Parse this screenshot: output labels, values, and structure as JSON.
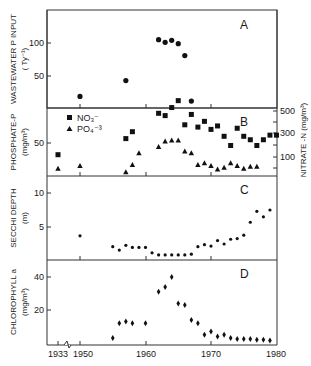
{
  "chart_data": [
    {
      "panel": "A",
      "type": "scatter",
      "title": "",
      "ylabel": "WASTEWATER P INPUT",
      "ylabel_units": "(Ty⁻¹)",
      "xlabel": "",
      "yticks": [
        50,
        100
      ],
      "ylim": [
        0,
        148
      ],
      "series": [
        {
          "name": "Wastewater P input",
          "marker": "circle",
          "x": [
            1950,
            1957,
            1962,
            1963,
            1964,
            1965,
            1966,
            1967
          ],
          "y": [
            19,
            43,
            105,
            101,
            104,
            99,
            81,
            12
          ]
        }
      ]
    },
    {
      "panel": "B",
      "type": "scatter",
      "ylabel": "PHOSPHATE-P",
      "ylabel_units": "(mg/m³)",
      "ylabel_right": "NITRATE -N",
      "ylabel_right_units": "(mg/m³)",
      "yticks": [
        50
      ],
      "yticks_right": [
        100,
        300,
        500
      ],
      "ylim": [
        15,
        93
      ],
      "ylim_right": [
        0,
        620
      ],
      "legend": [
        {
          "label": "NO₃⁻",
          "marker": "square"
        },
        {
          "label": "PO₄⁻³",
          "marker": "triangle"
        }
      ],
      "series": [
        {
          "name": "NO3-",
          "axis": "right",
          "marker": "square",
          "x": [
            1933,
            1957,
            1958,
            1962,
            1963,
            1964,
            1965,
            1966,
            1967,
            1968,
            1969,
            1970,
            1971,
            1972,
            1973,
            1974,
            1975,
            1976,
            1977,
            1978,
            1979,
            1980
          ],
          "y": [
            120,
            260,
            320,
            480,
            460,
            530,
            590,
            380,
            470,
            360,
            410,
            340,
            370,
            280,
            200,
            350,
            280,
            250,
            200,
            250,
            290,
            290
          ]
        },
        {
          "name": "PO4-3",
          "axis": "left",
          "marker": "triangle",
          "x": [
            1933,
            1950,
            1957,
            1958,
            1959,
            1962,
            1963,
            1964,
            1965,
            1966,
            1967,
            1968,
            1969,
            1970,
            1971,
            1972,
            1973,
            1974,
            1975,
            1976,
            1977,
            1978
          ],
          "y": [
            22,
            25,
            18,
            26,
            39,
            46,
            52,
            53,
            53,
            41,
            39,
            26,
            28,
            25,
            21,
            23,
            28,
            25,
            22,
            24,
            24
          ]
        }
      ]
    },
    {
      "panel": "C",
      "type": "scatter",
      "ylabel": "SECCHI DEPTH",
      "ylabel_units": "(m)",
      "yticks": [
        5,
        10
      ],
      "ylim": [
        0,
        12.5
      ],
      "series": [
        {
          "name": "Secchi depth",
          "marker": "dot",
          "x": [
            1950,
            1955,
            1956,
            1957,
            1958,
            1959,
            1960,
            1961,
            1962,
            1963,
            1964,
            1965,
            1966,
            1967,
            1968,
            1969,
            1970,
            1971,
            1972,
            1973,
            1974,
            1975,
            1976,
            1977,
            1978,
            1979
          ],
          "y": [
            3.7,
            2.1,
            1.6,
            2.3,
            2.0,
            2.0,
            2.0,
            1.2,
            0.9,
            0.9,
            0.9,
            0.9,
            0.9,
            1.0,
            2.1,
            2.4,
            2.2,
            3.0,
            2.5,
            3.2,
            3.3,
            3.8,
            5.7,
            7.3,
            6.5,
            7.5
          ]
        }
      ]
    },
    {
      "panel": "D",
      "type": "scatter",
      "ylabel": "CHLOROPHYLL a",
      "ylabel_units": "(mg/m³)",
      "yticks": [
        20,
        40
      ],
      "ylim": [
        0,
        50
      ],
      "xlabel": "",
      "xticks": [
        "1933",
        "1950",
        "1960",
        "1970",
        "1980"
      ],
      "series": [
        {
          "name": "Chlorophyll a",
          "marker": "diamond",
          "x": [
            1955,
            1956,
            1957,
            1958,
            1960,
            1962,
            1963,
            1964,
            1965,
            1966,
            1967,
            1968,
            1969,
            1970,
            1971,
            1972,
            1973,
            1974,
            1975,
            1976,
            1977,
            1978,
            1979
          ],
          "y": [
            3,
            12,
            13,
            12,
            12,
            31,
            34,
            40,
            24,
            23,
            14,
            12,
            5,
            7,
            4,
            5,
            3,
            2.5,
            2.5,
            2.5,
            2,
            2,
            1.5
          ]
        }
      ]
    }
  ],
  "labels": {
    "panel_a": "A",
    "panel_b": "B",
    "panel_c": "C",
    "panel_d": "D",
    "a_ylabel": "WASTEWATER P INPUT",
    "a_units": "( Ty⁻¹)",
    "b_ylabel": "PHOSPHATE-P",
    "b_units": "(mg/m³)",
    "b_right_label": "NITRATE -N (mg/m³)",
    "c_ylabel": "SECCHI DEPTH",
    "c_units": "(m)",
    "d_ylabel": "CHLOROPHYLL a",
    "d_units": "(mg/m³)",
    "legend_no3": "NO₃⁻",
    "legend_po4": "PO₄⁻³",
    "a_tick_100": "100",
    "a_tick_50": "50",
    "b_tick_50": "50",
    "b_rtick_500": "500",
    "b_rtick_300": "300",
    "b_rtick_100": "100",
    "c_tick_10": "10",
    "c_tick_5": "5",
    "d_tick_40": "40",
    "d_tick_20": "20",
    "x_1933": "1933",
    "x_1950": "1950",
    "x_1960": "1960",
    "x_1970": "1970",
    "x_1980": "1980"
  }
}
